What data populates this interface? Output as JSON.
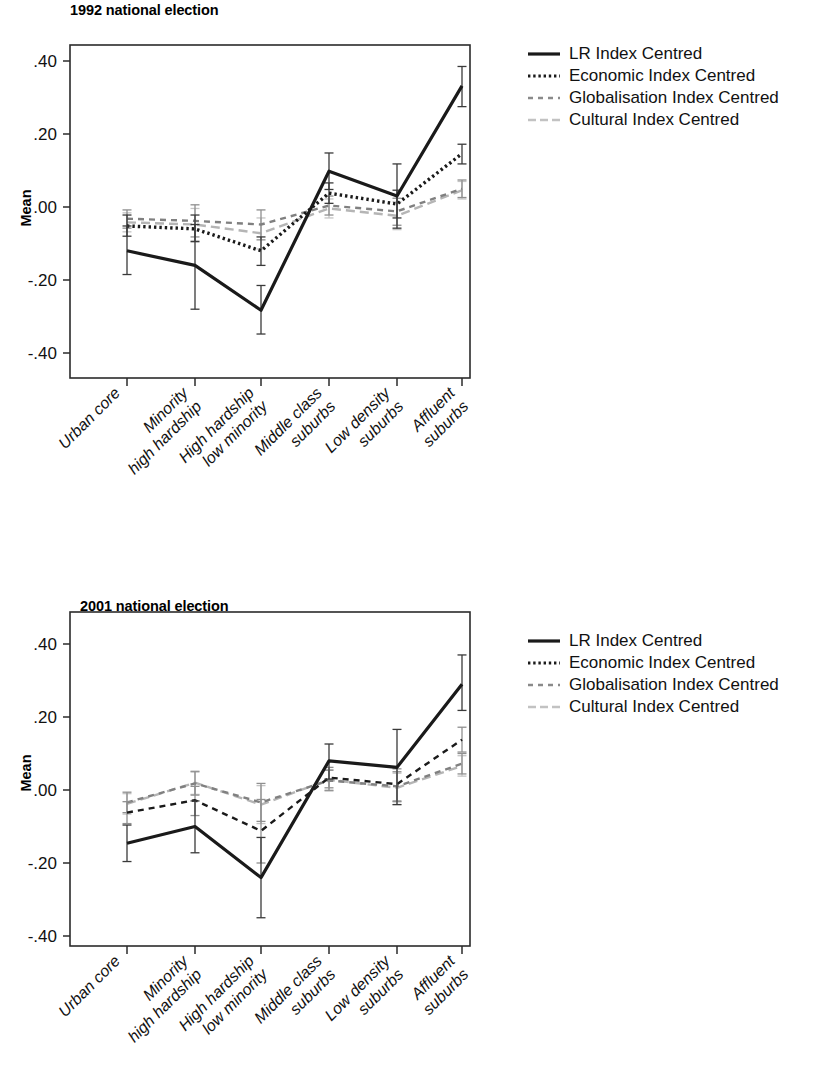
{
  "figure": {
    "y_axis_label": "Mean",
    "y_ticks": [
      ".40",
      ".20",
      ".00",
      "-.20",
      "-.40"
    ],
    "categories": [
      "Urban core",
      "Minority\nhigh hardship",
      "High hardship\nlow minority",
      "Middle class\nsuburbs",
      "Low density\nsuburbs",
      "Affluent\nsuburbs"
    ],
    "legend": [
      {
        "label": "LR Index Centred",
        "style": "solid",
        "color": "#1a1a1a",
        "swatch": "legend-swatch-solid"
      },
      {
        "label": "Economic Index Centred",
        "style": "dotted",
        "color": "#1a1a1a",
        "swatch": "legend-swatch-dotted"
      },
      {
        "label": "Globalisation Index Centred",
        "style": "dashed",
        "color": "#808080",
        "swatch": "legend-swatch-dashed"
      },
      {
        "label": "Cultural Index Centred",
        "style": "longdash",
        "color": "#b5b5b5",
        "swatch": "legend-swatch-longdash"
      }
    ]
  },
  "panels": [
    {
      "id": "panel-1992",
      "title": "1992 national election"
    },
    {
      "id": "panel-2001",
      "title": "2001 national election"
    }
  ],
  "chart_data": [
    {
      "type": "line",
      "title": "1992 national election",
      "xlabel": "",
      "ylabel": "Mean",
      "ylim": [
        -0.45,
        0.45
      ],
      "yticks": [
        -0.4,
        -0.2,
        0.0,
        0.2,
        0.4
      ],
      "ytick_labels": [
        "-.40",
        "-.20",
        ".00",
        ".20",
        ".40"
      ],
      "grid": false,
      "legend_position": "right",
      "error_bars": "95% CI",
      "categories": [
        "Urban core",
        "Minority high hardship",
        "High hardship low minority",
        "Middle class suburbs",
        "Low density suburbs",
        "Affluent suburbs"
      ],
      "series": [
        {
          "name": "LR Index Centred",
          "style": "solid",
          "color": "#1a1a1a",
          "values": [
            -0.12,
            -0.16,
            -0.283,
            0.098,
            0.03,
            0.332
          ],
          "err_low": [
            -0.185,
            -0.28,
            -0.348,
            0.048,
            -0.058,
            0.275
          ],
          "err_high": [
            -0.052,
            -0.048,
            -0.215,
            0.148,
            0.118,
            0.385
          ]
        },
        {
          "name": "Economic Index Centred",
          "style": "dotted",
          "color": "#1a1a1a",
          "values": [
            -0.052,
            -0.06,
            -0.12,
            0.038,
            0.008,
            0.146
          ],
          "err_low": [
            -0.08,
            -0.095,
            -0.16,
            0.01,
            -0.03,
            0.118
          ],
          "err_high": [
            -0.022,
            -0.022,
            -0.082,
            0.066,
            0.046,
            0.172
          ]
        },
        {
          "name": "Globalisation Index Centred",
          "style": "dashed",
          "color": "#808080",
          "values": [
            -0.032,
            -0.038,
            -0.048,
            0.004,
            -0.012,
            0.05
          ],
          "err_low": [
            -0.058,
            -0.082,
            -0.09,
            -0.022,
            -0.05,
            0.026
          ],
          "err_high": [
            -0.008,
            0.006,
            -0.008,
            0.03,
            0.024,
            0.074
          ]
        },
        {
          "name": "Cultural Index Centred",
          "style": "longdash",
          "color": "#b5b5b5",
          "values": [
            -0.042,
            -0.048,
            -0.072,
            -0.004,
            -0.024,
            0.046
          ],
          "err_low": [
            -0.068,
            -0.092,
            -0.115,
            -0.03,
            -0.062,
            0.022
          ],
          "err_high": [
            -0.016,
            -0.004,
            -0.03,
            0.022,
            0.014,
            0.07
          ]
        }
      ]
    },
    {
      "type": "line",
      "title": "2001 national election",
      "xlabel": "",
      "ylabel": "Mean",
      "ylim": [
        -0.45,
        0.45
      ],
      "yticks": [
        -0.4,
        -0.2,
        0.0,
        0.2,
        0.4
      ],
      "ytick_labels": [
        "-.40",
        "-.20",
        ".00",
        ".20",
        ".40"
      ],
      "grid": false,
      "legend_position": "right",
      "error_bars": "95% CI",
      "categories": [
        "Urban core",
        "Minority high hardship",
        "High hardship low minority",
        "Middle class suburbs",
        "Low density suburbs",
        "Affluent suburbs"
      ],
      "series": [
        {
          "name": "LR Index Centred",
          "style": "solid",
          "color": "#1a1a1a",
          "values": [
            -0.146,
            -0.1,
            -0.24,
            0.08,
            0.062,
            0.29
          ],
          "err_low": [
            -0.196,
            -0.172,
            -0.35,
            0.03,
            -0.04,
            0.218
          ],
          "err_high": [
            -0.096,
            -0.03,
            -0.13,
            0.126,
            0.166,
            0.37
          ]
        },
        {
          "name": "Economic Index Centred",
          "style": "dashed",
          "color": "#1a1a1a",
          "values": [
            -0.062,
            -0.028,
            -0.112,
            0.034,
            0.016,
            0.138
          ],
          "err_low": [
            -0.092,
            -0.07,
            -0.2,
            0.006,
            -0.03,
            0.104
          ],
          "err_high": [
            -0.032,
            0.01,
            -0.026,
            0.062,
            0.058,
            0.172
          ]
        },
        {
          "name": "Globalisation Index Centred",
          "style": "dashed",
          "color": "#808080",
          "values": [
            -0.034,
            0.018,
            -0.034,
            0.026,
            0.01,
            0.072
          ],
          "err_low": [
            -0.062,
            -0.014,
            -0.086,
            -0.002,
            -0.032,
            0.044
          ],
          "err_high": [
            -0.006,
            0.05,
            0.018,
            0.054,
            0.05,
            0.1
          ]
        },
        {
          "name": "Cultural Index Centred",
          "style": "longdash",
          "color": "#b5b5b5",
          "values": [
            -0.038,
            0.02,
            -0.04,
            0.028,
            0.006,
            0.066
          ],
          "err_low": [
            -0.066,
            -0.012,
            -0.092,
            0.0,
            -0.04,
            0.038
          ],
          "err_high": [
            -0.01,
            0.052,
            0.012,
            0.056,
            0.046,
            0.094
          ]
        }
      ]
    }
  ]
}
